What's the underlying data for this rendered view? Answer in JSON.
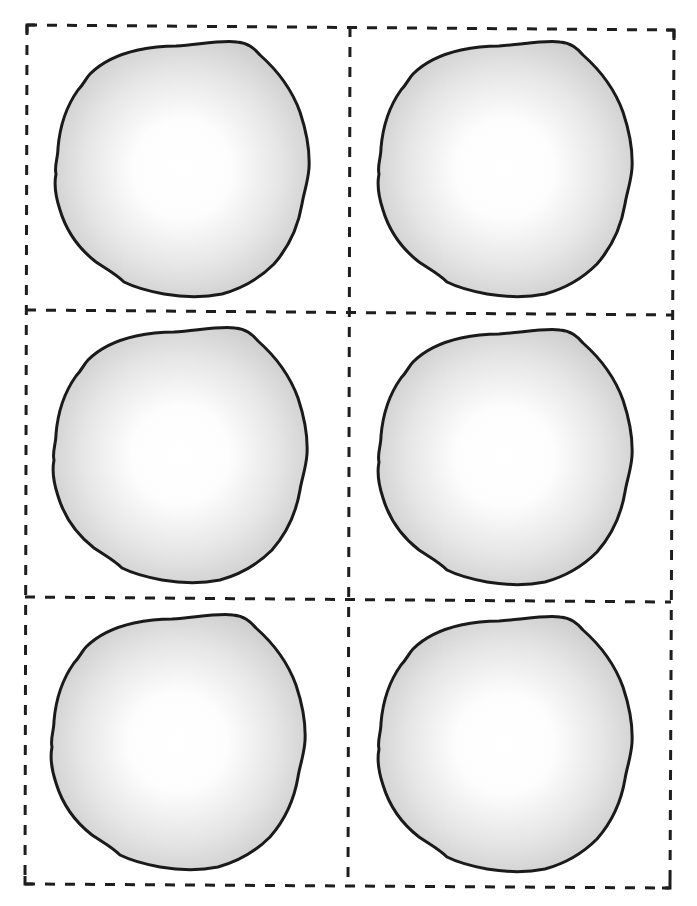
{
  "page": {
    "top_text_cut_off": "",
    "layout": {
      "rows": 3,
      "columns": 2
    },
    "colors": {
      "cut_line": "#1e1e1e",
      "outline": "#1a1a1a",
      "fill_center": "#ffffff",
      "fill_edge": "#cfcfcf"
    }
  },
  "cut_grid": {
    "style": "dashed",
    "dash_length": 10,
    "gap_length": 10,
    "stroke_width": 3
  },
  "cells": [
    {
      "row": 1,
      "column": 1,
      "shape": "circle-blob"
    },
    {
      "row": 1,
      "column": 2,
      "shape": "circle-blob"
    },
    {
      "row": 2,
      "column": 1,
      "shape": "circle-blob"
    },
    {
      "row": 2,
      "column": 2,
      "shape": "circle-blob"
    },
    {
      "row": 3,
      "column": 1,
      "shape": "circle-blob"
    },
    {
      "row": 3,
      "column": 2,
      "shape": "circle-blob"
    }
  ]
}
